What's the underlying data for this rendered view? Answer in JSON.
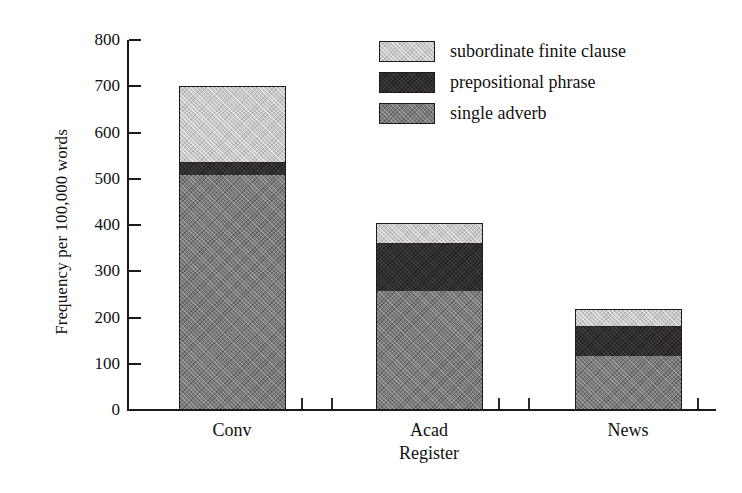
{
  "chart_data": {
    "type": "bar",
    "subtype": "stacked",
    "title": "",
    "xlabel": "Register",
    "ylabel": "Frequency per 100,000 words",
    "categories": [
      "Conv",
      "Acad",
      "News"
    ],
    "series": [
      {
        "name": "single adverb",
        "values": [
          505,
          255,
          115
        ],
        "color": "#7e7c7a"
      },
      {
        "name": "prepositional phrase",
        "values": [
          30,
          105,
          65
        ],
        "color": "#332f2f"
      },
      {
        "name": "subordinate finite clause",
        "values": [
          165,
          45,
          38
        ],
        "color": "#c9c9c7"
      }
    ],
    "totals": [
      700,
      405,
      218
    ],
    "ylim": [
      0,
      800
    ],
    "yticks": [
      0,
      100,
      200,
      300,
      400,
      500,
      600,
      700,
      800
    ],
    "ytick_labels": [
      "0",
      "100",
      "200",
      "300",
      "400",
      "500",
      "600",
      "700",
      "800"
    ],
    "grid": false,
    "legend_position": "top-right",
    "legend_order": [
      "subordinate finite clause",
      "prepositional phrase",
      "single adverb"
    ]
  },
  "legend": {
    "items": [
      {
        "label": "subordinate finite clause",
        "swatch": "light-gray-swatch"
      },
      {
        "label": "prepositional phrase",
        "swatch": "dark-gray-swatch"
      },
      {
        "label": "single adverb",
        "swatch": "medium-gray-swatch"
      }
    ]
  },
  "axes": {
    "y_title": "Frequency per 100,000 words",
    "x_title": "Register"
  }
}
